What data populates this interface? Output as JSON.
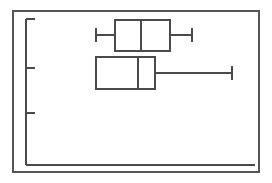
{
  "figure": {
    "name": "box-plot-figure",
    "width": 272,
    "height": 183,
    "background_color": "#ffffff",
    "frame": {
      "name": "outer-frame",
      "x": 13,
      "y": 11,
      "width": 246,
      "height": 161,
      "stroke_color": "#555555",
      "stroke_width": 1.6
    }
  },
  "axes": {
    "y_axis": {
      "name": "y-axis-spine",
      "x": 26,
      "y_top": 19,
      "y_bottom": 165,
      "stroke_color": "#4a4a4a",
      "stroke_width": 1.6,
      "tick_direction": "right",
      "tick_length": 9,
      "ticks": [
        19,
        68,
        113,
        165
      ],
      "tick_labels": [
        "",
        "",
        "",
        ""
      ]
    },
    "x_axis": {
      "name": "x-axis-spine",
      "y": 165,
      "x_left": 26,
      "x_right": 255,
      "stroke_color": "#4a4a4a",
      "stroke_width": 1.6,
      "ticks": [],
      "tick_labels": []
    },
    "title": "",
    "xlabel": "",
    "ylabel": ""
  },
  "chart_data": {
    "type": "box",
    "orientation": "horizontal",
    "title": "",
    "xlabel": "",
    "ylabel": "",
    "grid": false,
    "legend": "none",
    "xlim": [
      26,
      255
    ],
    "categories": [
      "Group 1",
      "Group 2"
    ],
    "boxes": [
      {
        "name": "box-plot-upper",
        "category": "Group 1",
        "whisker_low": 96,
        "q1": 115,
        "median": 141,
        "q3": 170,
        "whisker_high": 192,
        "y_top": 20,
        "y_bottom": 51,
        "center_y": 35,
        "fill": "none",
        "stroke_color": "#4a4a4a",
        "stroke_width": 1.6,
        "cap_half_height": 7
      },
      {
        "name": "box-plot-lower",
        "category": "Group 2",
        "whisker_low": 96,
        "q1": 96,
        "median": 138,
        "q3": 155,
        "whisker_high": 232,
        "y_top": 57,
        "y_bottom": 89,
        "center_y": 73,
        "fill": "none",
        "stroke_color": "#4a4a4a",
        "stroke_width": 1.6,
        "cap_half_height": 7
      }
    ]
  }
}
